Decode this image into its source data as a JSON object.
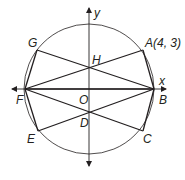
{
  "diagram": {
    "type": "circle-with-inscribed-chords",
    "axes": {
      "x_label": "x",
      "y_label": "y"
    },
    "points": {
      "A": {
        "label": "A(4, 3)",
        "x": 143,
        "y": 50
      },
      "B": {
        "label": "B",
        "x": 154,
        "y": 89
      },
      "C": {
        "label": "C",
        "x": 143,
        "y": 131
      },
      "D": {
        "label": "D",
        "x": 90,
        "y": 112
      },
      "E": {
        "label": "E",
        "x": 38,
        "y": 131
      },
      "F": {
        "label": "F",
        "x": 25,
        "y": 89
      },
      "G": {
        "label": "G",
        "x": 37,
        "y": 50
      },
      "H": {
        "label": "H",
        "x": 90,
        "y": 69
      },
      "O": {
        "label": "O",
        "x": 89,
        "y": 89
      }
    },
    "circle": {
      "cx": 89,
      "cy": 89,
      "r": 65
    },
    "segments": [
      [
        "F",
        "A"
      ],
      [
        "G",
        "B"
      ],
      [
        "F",
        "C"
      ],
      [
        "E",
        "B"
      ],
      [
        "F",
        "G"
      ],
      [
        "F",
        "E"
      ],
      [
        "B",
        "A"
      ],
      [
        "B",
        "C"
      ],
      [
        "F",
        "B"
      ]
    ],
    "stroke_color": "#231f20"
  }
}
